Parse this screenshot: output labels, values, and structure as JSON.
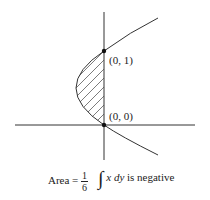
{
  "figure": {
    "points": [
      {
        "label": "(0, 1)",
        "x": 104,
        "y": 51
      },
      {
        "label": "(0, 0)",
        "x": 104,
        "y": 125
      }
    ],
    "curve": "parabola x = y^2 - y opening right",
    "shaded_region": "between curve and y-axis from y=0 to y=1 (hatched)"
  },
  "captions": {
    "area_prefix": "Area =",
    "area_num": "1",
    "area_den": "6",
    "integral_symbol": "∫",
    "integral_x": "x",
    "integral_dy": "dy",
    "integral_suffix": "is negative"
  },
  "colors": {
    "line": "#333333",
    "hatch": "#444444"
  }
}
